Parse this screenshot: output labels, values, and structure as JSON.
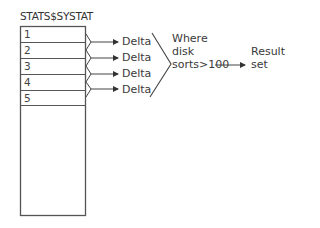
{
  "diagram": {
    "table": {
      "title": "STATS$SYSTAT",
      "rows": [
        "1",
        "2",
        "3",
        "4",
        "5"
      ]
    },
    "deltas": [
      "Delta",
      "Delta",
      "Delta",
      "Delta"
    ],
    "filter": {
      "line1": "Where",
      "line2": "disk",
      "line3": "sorts>100"
    },
    "result": {
      "line1": "Result",
      "line2": "set"
    },
    "colors": {
      "line": "#444444",
      "text": "#3a3a3a",
      "background": "#ffffff"
    }
  }
}
